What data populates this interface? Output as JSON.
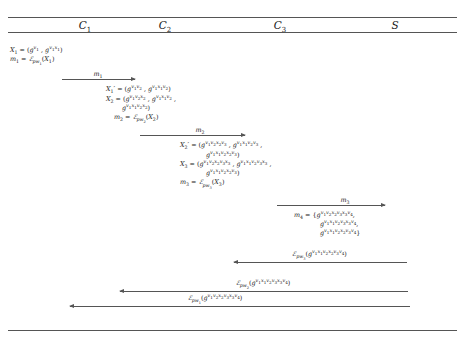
{
  "figure": {
    "type": "protocol-message-sequence-diagram",
    "parties": [
      {
        "id": "c1",
        "label": "C",
        "index": "1"
      },
      {
        "id": "c2",
        "label": "C",
        "index": "2"
      },
      {
        "id": "c3",
        "label": "C",
        "index": "3"
      },
      {
        "id": "s",
        "label": "S",
        "index": ""
      }
    ]
  },
  "blocks": {
    "c1": {
      "lines": [
        "X₁ = (g^v1 , g^v1x1)",
        "m₁ = E_pw1(X₁)"
      ]
    },
    "c2": {
      "lines": [
        "X′₁ = (g^v1v2 , g^v1x1v2)",
        "X₂ = (g^v1v2x2 , g^v1x1v2 ,",
        "g^v1x1v2x2)",
        "m₂ = E_pw2(X₂)"
      ]
    },
    "c3": {
      "lines": [
        "X′₂ = (g^v1v2x2v3 , g^v1x1v2v3 ,",
        "g^v1x1v2x2v3)",
        "X₃ = (g^v1v2x2v3x3 , g^v1x1v2v3x3 ,",
        "g^v1x1v2x2v3)",
        "m₃ = E_pw3(X₃)"
      ]
    },
    "s": {
      "lines": [
        "m₄ = {g^v1v2x2v3x3v4,",
        "g^v1x1v2v3x3v4,",
        "g^v1x1v2x2v3v4}"
      ]
    }
  },
  "messages": [
    {
      "id": "m1",
      "label": "m₁",
      "direction": "right",
      "from": "C1",
      "to": "C2"
    },
    {
      "id": "m2",
      "label": "m₂",
      "direction": "right",
      "from": "C2",
      "to": "C3"
    },
    {
      "id": "m3",
      "label": "m₃",
      "direction": "right",
      "from": "C3",
      "to": "S"
    },
    {
      "id": "r3",
      "label": "E_pw3(g^v1x1v2x2v3v4)",
      "direction": "left",
      "from": "S",
      "to": "C3"
    },
    {
      "id": "r2",
      "label": "E_pw2(g^v1x1v2v3x3v4)",
      "direction": "left",
      "from": "S",
      "to": "C2"
    },
    {
      "id": "r1",
      "label": "E_pw1(g^v1v2x2v3x3v4)",
      "direction": "left",
      "from": "S",
      "to": "C1"
    }
  ],
  "symbols": {
    "generator": "g",
    "encryption": "E",
    "passwords": [
      "pw1",
      "pw2",
      "pw3"
    ],
    "ephemeral": [
      "v1",
      "v2",
      "v3",
      "v4"
    ],
    "secrets": [
      "x1",
      "x2",
      "x3"
    ]
  },
  "colors": {
    "rule": "#555555",
    "text": "#1a1a1a",
    "background": "#ffffff"
  }
}
